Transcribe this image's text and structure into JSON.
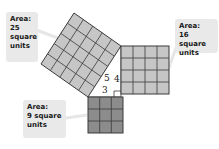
{
  "diagram": {
    "squares": [
      {
        "id": "hypotenuse",
        "grid": 5,
        "area_label": [
          "Area:",
          "25",
          "square",
          "units"
        ],
        "fill": "#c6c6c6"
      },
      {
        "id": "leg_long",
        "grid": 4,
        "area_label": [
          "Area:",
          "16 square",
          "units"
        ],
        "fill": "#c6c6c6"
      },
      {
        "id": "leg_short",
        "grid": 3,
        "area_label": [
          "Area:",
          "9 square",
          "units"
        ],
        "fill": "#8c8c8c"
      }
    ],
    "triangle_sides": {
      "hypotenuse": "5",
      "vertical_leg": "4",
      "horizontal_leg": "3"
    },
    "colors": {
      "callout_bg": "#e9e9e9",
      "grid_line": "#3a3a3a",
      "light_square": "#c6c6c6",
      "dark_square": "#8c8c8c"
    }
  }
}
